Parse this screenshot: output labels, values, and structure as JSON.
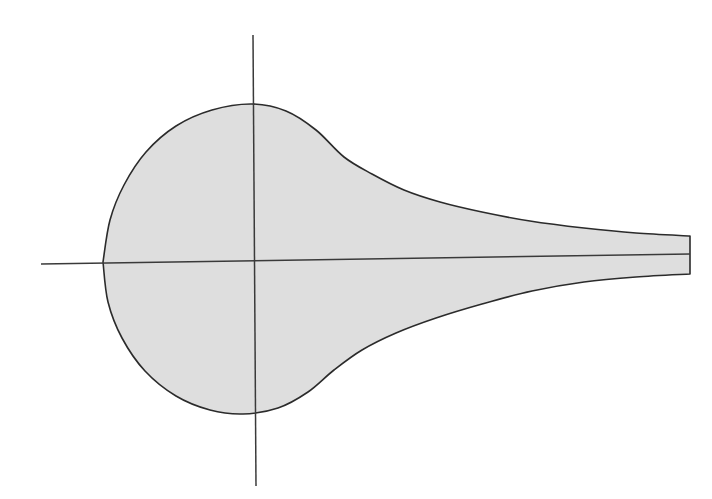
{
  "figure": {
    "kind": "mathematical-diagram",
    "title": "",
    "background_color": "#ffffff",
    "canvas": {
      "width": 712,
      "height": 499
    }
  },
  "chart_data": {
    "type": "area",
    "title": "",
    "subtitle": "",
    "xlabel": "",
    "ylabel": "",
    "grid": false,
    "legend": null,
    "annotations": [],
    "origin": {
      "x": 254,
      "y": 262
    },
    "axes": {
      "x_axis": {
        "x_start": 41,
        "y_start": 264,
        "x_end": 690,
        "y_end": 254
      },
      "y_axis": {
        "x_start": 253,
        "y_start": 35,
        "x_end": 256,
        "y_end": 486
      }
    },
    "region": {
      "fill_color": "#dedede",
      "stroke_color": "#2b2b2b",
      "stroke_width": 1.6,
      "bbox": {
        "left": 103,
        "top": 104,
        "right": 690,
        "bottom": 414
      },
      "extreme_points": {
        "leftmost": {
          "x": 103,
          "y": 262
        },
        "topmost": {
          "x": 252,
          "y": 104
        },
        "bottommost": {
          "x": 243,
          "y": 414
        },
        "right_edge_top": {
          "x": 690,
          "y": 236
        },
        "right_edge_bottom": {
          "x": 690,
          "y": 274
        }
      },
      "upper_boundary": [
        {
          "x": 103,
          "y": 262
        },
        {
          "x": 110,
          "y": 220
        },
        {
          "x": 124,
          "y": 185
        },
        {
          "x": 146,
          "y": 152
        },
        {
          "x": 176,
          "y": 126
        },
        {
          "x": 212,
          "y": 110
        },
        {
          "x": 252,
          "y": 104
        },
        {
          "x": 286,
          "y": 111
        },
        {
          "x": 316,
          "y": 130
        },
        {
          "x": 344,
          "y": 157
        },
        {
          "x": 372,
          "y": 174
        },
        {
          "x": 404,
          "y": 190
        },
        {
          "x": 440,
          "y": 202
        },
        {
          "x": 482,
          "y": 212
        },
        {
          "x": 530,
          "y": 221
        },
        {
          "x": 584,
          "y": 228
        },
        {
          "x": 636,
          "y": 233
        },
        {
          "x": 690,
          "y": 236
        }
      ],
      "lower_boundary": [
        {
          "x": 103,
          "y": 262
        },
        {
          "x": 108,
          "y": 302
        },
        {
          "x": 122,
          "y": 338
        },
        {
          "x": 145,
          "y": 371
        },
        {
          "x": 176,
          "y": 396
        },
        {
          "x": 210,
          "y": 410
        },
        {
          "x": 243,
          "y": 414
        },
        {
          "x": 278,
          "y": 408
        },
        {
          "x": 308,
          "y": 392
        },
        {
          "x": 334,
          "y": 370
        },
        {
          "x": 362,
          "y": 350
        },
        {
          "x": 396,
          "y": 333
        },
        {
          "x": 436,
          "y": 318
        },
        {
          "x": 482,
          "y": 304
        },
        {
          "x": 532,
          "y": 291
        },
        {
          "x": 584,
          "y": 282
        },
        {
          "x": 636,
          "y": 277
        },
        {
          "x": 690,
          "y": 274
        }
      ]
    }
  }
}
